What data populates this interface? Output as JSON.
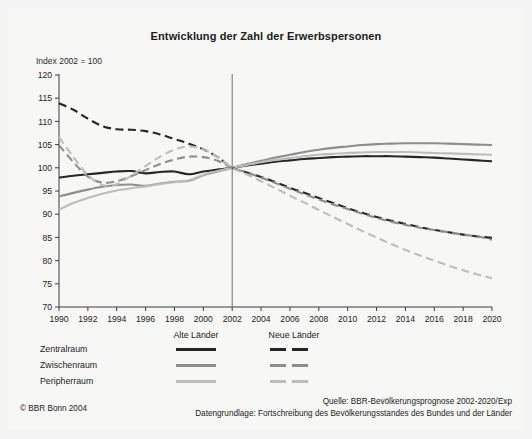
{
  "chart_title": "Entwicklung der Zahl der Erwerbspersonen",
  "axis_note": "Index 2002 = 100",
  "legend": {
    "column_headers": [
      "Alte Länder",
      "Neue Länder"
    ],
    "rows": [
      {
        "label": "Zentralraum",
        "color": "#262626"
      },
      {
        "label": "Zwischenraum",
        "color": "#8d8d8d"
      },
      {
        "label": "Peripherraum",
        "color": "#bdbdbd"
      }
    ]
  },
  "footer": {
    "copyright": "© BBR Bonn 2004",
    "source_line_1": "Quelle: BBR-Bevölkerungsprognose 2002-2020/Exp",
    "source_line_2": "Datengrundlage: Fortschreibung des Bevölkerungsstandes des Bundes und der Länder"
  },
  "chart_data": {
    "type": "line",
    "title": "Entwicklung der Zahl der Erwerbspersonen",
    "subtitle": "Index 2002 = 100",
    "xlabel": "",
    "ylabel": "",
    "xlim": [
      1990,
      2020
    ],
    "ylim": [
      70,
      120
    ],
    "yticks": [
      70,
      75,
      80,
      85,
      90,
      95,
      100,
      105,
      110,
      115,
      120
    ],
    "xticks": [
      1990,
      1992,
      1994,
      1996,
      1998,
      2000,
      2002,
      2004,
      2006,
      2008,
      2010,
      2012,
      2014,
      2016,
      2018,
      2020
    ],
    "grid": false,
    "legend_position": "below-left",
    "reference_line_x": 2002,
    "annotations": [
      "Vertical reference line at 2002 marking boundary between observed data and forecast"
    ],
    "x": [
      1990,
      1991,
      1992,
      1993,
      1994,
      1995,
      1996,
      1997,
      1998,
      1999,
      2000,
      2001,
      2002,
      2003,
      2004,
      2005,
      2006,
      2007,
      2008,
      2009,
      2010,
      2011,
      2012,
      2013,
      2014,
      2015,
      2016,
      2017,
      2018,
      2019,
      2020
    ],
    "series": [
      {
        "name": "Zentralraum – Alte Länder",
        "region": "Zentralraum",
        "area": "Alte Länder",
        "color": "#262626",
        "style": "solid",
        "values": [
          97.9,
          98.3,
          98.6,
          98.9,
          99.2,
          99.3,
          98.8,
          99.1,
          99.2,
          98.6,
          99.2,
          99.6,
          100.0,
          100.5,
          100.9,
          101.3,
          101.6,
          101.9,
          102.1,
          102.3,
          102.4,
          102.5,
          102.5,
          102.5,
          102.4,
          102.3,
          102.2,
          102.0,
          101.8,
          101.6,
          101.4
        ]
      },
      {
        "name": "Zwischenraum – Alte Länder",
        "region": "Zwischenraum",
        "area": "Alte Länder",
        "color": "#8d8d8d",
        "style": "solid",
        "values": [
          93.8,
          94.6,
          95.3,
          95.9,
          96.3,
          96.4,
          96.1,
          96.6,
          97.0,
          97.2,
          98.4,
          99.2,
          100.0,
          100.8,
          101.5,
          102.2,
          102.8,
          103.4,
          103.9,
          104.3,
          104.6,
          104.9,
          105.1,
          105.2,
          105.3,
          105.3,
          105.3,
          105.2,
          105.1,
          105.0,
          104.9
        ]
      },
      {
        "name": "Peripherraum – Alte Länder",
        "region": "Peripherraum",
        "area": "Alte Länder",
        "color": "#bdbdbd",
        "style": "solid",
        "values": [
          91.0,
          92.4,
          93.5,
          94.4,
          95.1,
          95.6,
          96.0,
          96.5,
          96.9,
          97.3,
          98.5,
          99.3,
          100.0,
          100.6,
          101.2,
          101.7,
          102.1,
          102.5,
          102.8,
          103.0,
          103.2,
          103.3,
          103.4,
          103.4,
          103.4,
          103.3,
          103.2,
          103.1,
          103.0,
          102.9,
          102.8
        ]
      },
      {
        "name": "Zentralraum – Neue Länder",
        "region": "Zentralraum",
        "area": "Neue Länder",
        "color": "#262626",
        "style": "dashed",
        "values": [
          113.9,
          112.5,
          110.6,
          109.0,
          108.3,
          108.2,
          107.9,
          107.2,
          106.2,
          105.2,
          104.0,
          102.3,
          100.0,
          99.0,
          98.0,
          96.9,
          95.7,
          94.6,
          93.5,
          92.4,
          91.3,
          90.3,
          89.4,
          88.6,
          87.9,
          87.2,
          86.6,
          86.1,
          85.6,
          85.2,
          84.9
        ]
      },
      {
        "name": "Zwischenraum – Neue Länder",
        "region": "Zwischenraum",
        "area": "Neue Länder",
        "color": "#8d8d8d",
        "style": "dashed",
        "values": [
          104.9,
          101.2,
          98.1,
          96.8,
          97.1,
          98.2,
          99.5,
          100.8,
          101.8,
          102.4,
          102.3,
          101.5,
          100.0,
          99.0,
          97.9,
          96.7,
          95.5,
          94.3,
          93.2,
          92.1,
          91.1,
          90.1,
          89.2,
          88.4,
          87.7,
          87.1,
          86.6,
          86.1,
          85.6,
          85.2,
          84.5
        ]
      },
      {
        "name": "Peripherraum – Neue Länder",
        "region": "Peripherraum",
        "area": "Neue Länder",
        "color": "#bdbdbd",
        "style": "dashed",
        "values": [
          106.6,
          102.3,
          98.4,
          96.3,
          96.5,
          98.3,
          100.4,
          102.4,
          103.9,
          104.6,
          104.0,
          102.3,
          100.0,
          98.6,
          97.1,
          95.6,
          94.0,
          92.5,
          90.9,
          89.4,
          87.9,
          86.4,
          85.0,
          83.6,
          82.3,
          81.1,
          80.0,
          78.9,
          77.9,
          77.0,
          76.2
        ]
      }
    ]
  }
}
